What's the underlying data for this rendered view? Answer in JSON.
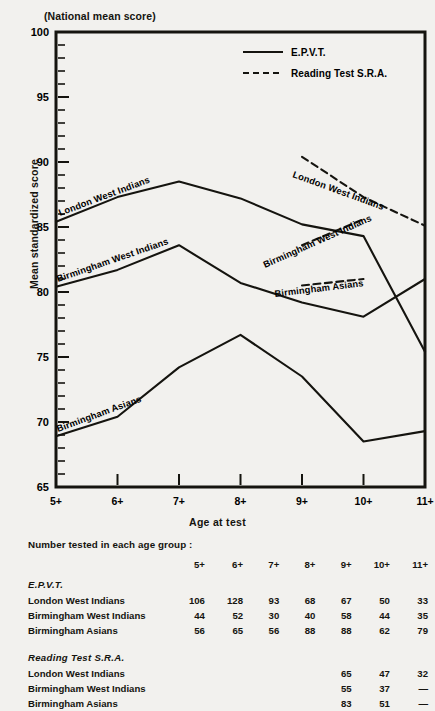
{
  "figure": {
    "national_mean_note": "(National mean score)",
    "ylabel": "Mean standardized score",
    "xlabel": "Age at test"
  },
  "legend": {
    "items": [
      {
        "label": "E.P.V.T.",
        "style": "solid"
      },
      {
        "label": "Reading Test S.R.A.",
        "style": "dashed"
      }
    ]
  },
  "curve_labels": {
    "epvt_london": "London West Indians",
    "epvt_bham_wi": "Birmingham West Indians",
    "epvt_bham_asian": "Birmingham Asians",
    "sra_london": "London West Indians",
    "sra_bham_wi": "Birmingham West Indians",
    "sra_bham_asian": "Birmingham Asians"
  },
  "chart_data": {
    "type": "line",
    "title": "",
    "xlabel": "Age at test",
    "ylabel": "Mean standardized score",
    "categories": [
      "5+",
      "6+",
      "7+",
      "8+",
      "9+",
      "10+",
      "11+"
    ],
    "ylim": [
      65,
      100
    ],
    "yticks": [
      65,
      70,
      75,
      80,
      85,
      90,
      95,
      100
    ],
    "minor_tick_step": 1,
    "grid": false,
    "legend_position": "top-right",
    "annotations": [
      "(National mean score) marks the 100 line"
    ],
    "series": [
      {
        "name": "London West Indians",
        "test": "E.P.V.T.",
        "style": "solid",
        "x": [
          "5+",
          "6+",
          "7+",
          "8+",
          "9+",
          "10+",
          "11+"
        ],
        "values": [
          85.4,
          87.3,
          88.5,
          87.2,
          85.2,
          84.3,
          75.4
        ]
      },
      {
        "name": "Birmingham West Indians",
        "test": "E.P.V.T.",
        "style": "solid",
        "x": [
          "5+",
          "6+",
          "7+",
          "8+",
          "9+",
          "10+",
          "11+"
        ],
        "values": [
          80.4,
          81.7,
          83.6,
          80.7,
          79.2,
          78.1,
          81.0
        ]
      },
      {
        "name": "Birmingham Asians",
        "test": "E.P.V.T.",
        "style": "solid",
        "x": [
          "5+",
          "6+",
          "7+",
          "8+",
          "9+",
          "10+",
          "11+"
        ],
        "values": [
          68.9,
          70.4,
          74.2,
          76.7,
          73.5,
          68.5,
          69.3
        ]
      },
      {
        "name": "London West Indians",
        "test": "Reading Test S.R.A.",
        "style": "dashed",
        "x": [
          "9+",
          "10+",
          "11+"
        ],
        "values": [
          90.4,
          87.3,
          85.1
        ]
      },
      {
        "name": "Birmingham West Indians",
        "test": "Reading Test S.R.A.",
        "style": "dashed",
        "x": [
          "9+",
          "10+"
        ],
        "values": [
          83.6,
          85.6
        ]
      },
      {
        "name": "Birmingham Asians",
        "test": "Reading Test S.R.A.",
        "style": "dashed",
        "x": [
          "9+",
          "10+"
        ],
        "values": [
          80.5,
          81.0
        ]
      }
    ]
  },
  "table": {
    "caption": "Number tested in each age group :",
    "columns": [
      "5+",
      "6+",
      "7+",
      "8+",
      "9+",
      "10+",
      "11+"
    ],
    "groups": [
      {
        "heading": "E.P.V.T.",
        "rows": [
          {
            "name": "London West Indians",
            "values": [
              "106",
              "128",
              "93",
              "68",
              "67",
              "50",
              "33"
            ]
          },
          {
            "name": "Birmingham West Indians",
            "values": [
              "44",
              "52",
              "30",
              "40",
              "58",
              "44",
              "35"
            ]
          },
          {
            "name": "Birmingham Asians",
            "values": [
              "56",
              "65",
              "56",
              "88",
              "88",
              "62",
              "79"
            ]
          }
        ]
      },
      {
        "heading": "Reading Test S.R.A.",
        "rows": [
          {
            "name": "London West Indians",
            "values": [
              "",
              "",
              "",
              "",
              "65",
              "47",
              "32"
            ]
          },
          {
            "name": "Birmingham West Indians",
            "values": [
              "",
              "",
              "",
              "",
              "55",
              "37",
              "—"
            ]
          },
          {
            "name": "Birmingham Asians",
            "values": [
              "",
              "",
              "",
              "",
              "83",
              "51",
              "—"
            ]
          }
        ]
      }
    ]
  },
  "colors": {
    "ink": "#15140f",
    "paper": "#f2f1ee"
  }
}
